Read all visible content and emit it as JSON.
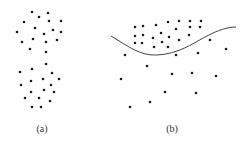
{
  "figure": {
    "dot_color": "#1a1a1a",
    "curve_color": "#444444",
    "dot_radius": 1.3,
    "panels": [
      {
        "id": "a",
        "label": "(a)",
        "label_pos": [
          42,
          131
        ],
        "clusters": [
          {
            "name": "upper-cluster",
            "points": [
              [
                32,
                12
              ],
              [
                48,
                13
              ],
              [
                39,
                17
              ],
              [
                24,
                22
              ],
              [
                49,
                21
              ],
              [
                61,
                21
              ],
              [
                35,
                28
              ],
              [
                17,
                32
              ],
              [
                53,
                30
              ],
              [
                61,
                32
              ],
              [
                44,
                34
              ],
              [
                33,
                39
              ],
              [
                22,
                42
              ],
              [
                46,
                42
              ],
              [
                57,
                40
              ],
              [
                30,
                49
              ],
              [
                46,
                52
              ]
            ]
          },
          {
            "name": "lower-cluster",
            "points": [
              [
                46,
                64
              ],
              [
                20,
                72
              ],
              [
                32,
                69
              ],
              [
                52,
                73
              ],
              [
                43,
                79
              ],
              [
                59,
                79
              ],
              [
                31,
                81
              ],
              [
                21,
                85
              ],
              [
                51,
                85
              ],
              [
                44,
                90
              ],
              [
                54,
                92
              ],
              [
                31,
                92
              ],
              [
                25,
                98
              ],
              [
                39,
                98
              ],
              [
                50,
                101
              ],
              [
                32,
                107
              ],
              [
                41,
                107
              ]
            ]
          }
        ]
      },
      {
        "id": "b",
        "label": "(b)",
        "label_pos": [
          172,
          131
        ],
        "curve": {
          "name": "decision-boundary",
          "path": "M111,36 C128,46 140,56 157,55 C178,54 192,44 205,37 C218,30 228,27 236,27"
        },
        "clusters": [
          {
            "name": "dense-cluster-above-curve",
            "points": [
              [
                135,
                27
              ],
              [
                143,
                26
              ],
              [
                156,
                25
              ],
              [
                168,
                22
              ],
              [
                179,
                21
              ],
              [
                190,
                21
              ],
              [
                201,
                21
              ],
              [
                190,
                27
              ],
              [
                200,
                27
              ],
              [
                176,
                29
              ],
              [
                135,
                36
              ],
              [
                143,
                35
              ],
              [
                161,
                33
              ],
              [
                153,
                38
              ],
              [
                169,
                37
              ],
              [
                179,
                40
              ],
              [
                189,
                35
              ],
              [
                135,
                43
              ],
              [
                142,
                43
              ],
              [
                162,
                42
              ],
              [
                154,
                47
              ],
              [
                168,
                47
              ]
            ]
          },
          {
            "name": "sparse-points-below-curve",
            "points": [
              [
                210,
                40
              ],
              [
                226,
                49
              ],
              [
                198,
                53
              ],
              [
                176,
                55
              ],
              [
                125,
                55
              ],
              [
                147,
                66
              ],
              [
                172,
                74
              ],
              [
                192,
                73
              ],
              [
                121,
                79
              ],
              [
                216,
                76
              ],
              [
                165,
                92
              ],
              [
                196,
                93
              ],
              [
                150,
                102
              ],
              [
                130,
                107
              ]
            ]
          }
        ]
      }
    ]
  }
}
